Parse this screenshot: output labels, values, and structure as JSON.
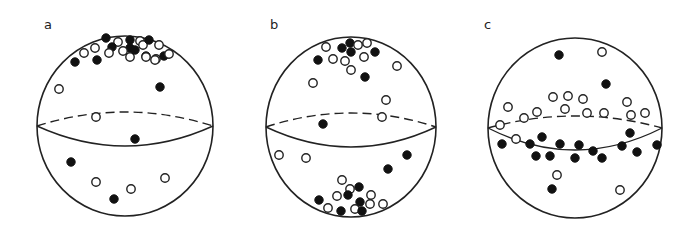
{
  "figure": {
    "legend_symbols": {
      "filled": "filled circle",
      "open": "open circle"
    },
    "colors": {
      "ink": "#222222",
      "background": "#ffffff"
    }
  },
  "panels": [
    {
      "label": "a",
      "label_pos": [
        44,
        29
      ],
      "sphere": {
        "cx": 125,
        "cy": 126,
        "rx": 88,
        "ry": 90
      },
      "equator": {
        "cy": 126,
        "ry": 20,
        "back_offset": -14
      },
      "points": [
        {
          "x": 106,
          "y": 38,
          "t": "filled"
        },
        {
          "x": 118,
          "y": 42,
          "t": "open"
        },
        {
          "x": 112,
          "y": 47,
          "t": "filled"
        },
        {
          "x": 130,
          "y": 40,
          "t": "filled"
        },
        {
          "x": 140,
          "y": 41,
          "t": "open"
        },
        {
          "x": 143,
          "y": 45,
          "t": "open"
        },
        {
          "x": 149,
          "y": 40,
          "t": "filled"
        },
        {
          "x": 159,
          "y": 45,
          "t": "open"
        },
        {
          "x": 130,
          "y": 48,
          "t": "filled"
        },
        {
          "x": 123,
          "y": 51,
          "t": "open"
        },
        {
          "x": 95,
          "y": 48,
          "t": "open"
        },
        {
          "x": 84,
          "y": 53,
          "t": "open"
        },
        {
          "x": 109,
          "y": 53,
          "t": "open"
        },
        {
          "x": 130,
          "y": 57,
          "t": "open"
        },
        {
          "x": 135,
          "y": 50,
          "t": "filled"
        },
        {
          "x": 146,
          "y": 56,
          "t": "filled"
        },
        {
          "x": 146,
          "y": 57,
          "t": "open"
        },
        {
          "x": 156,
          "y": 59,
          "t": "open"
        },
        {
          "x": 155,
          "y": 60,
          "t": "open"
        },
        {
          "x": 164,
          "y": 56,
          "t": "filled"
        },
        {
          "x": 169,
          "y": 54,
          "t": "open"
        },
        {
          "x": 75,
          "y": 62,
          "t": "filled"
        },
        {
          "x": 97,
          "y": 60,
          "t": "filled"
        },
        {
          "x": 59,
          "y": 89,
          "t": "open"
        },
        {
          "x": 160,
          "y": 87,
          "t": "filled"
        },
        {
          "x": 96,
          "y": 117,
          "t": "open"
        },
        {
          "x": 135,
          "y": 139,
          "t": "filled"
        },
        {
          "x": 71,
          "y": 162,
          "t": "filled"
        },
        {
          "x": 96,
          "y": 182,
          "t": "open"
        },
        {
          "x": 165,
          "y": 178,
          "t": "open"
        },
        {
          "x": 131,
          "y": 189,
          "t": "open"
        },
        {
          "x": 114,
          "y": 199,
          "t": "filled"
        }
      ]
    },
    {
      "label": "b",
      "label_pos": [
        270,
        29
      ],
      "sphere": {
        "cx": 351,
        "cy": 127,
        "rx": 85,
        "ry": 90
      },
      "equator": {
        "cy": 127,
        "ry": 20,
        "back_offset": -14
      },
      "points": [
        {
          "x": 326,
          "y": 47,
          "t": "open"
        },
        {
          "x": 342,
          "y": 48,
          "t": "filled"
        },
        {
          "x": 350,
          "y": 43,
          "t": "filled"
        },
        {
          "x": 358,
          "y": 45,
          "t": "open"
        },
        {
          "x": 367,
          "y": 43,
          "t": "open"
        },
        {
          "x": 351,
          "y": 52,
          "t": "filled"
        },
        {
          "x": 375,
          "y": 52,
          "t": "filled"
        },
        {
          "x": 318,
          "y": 60,
          "t": "filled"
        },
        {
          "x": 333,
          "y": 59,
          "t": "open"
        },
        {
          "x": 345,
          "y": 61,
          "t": "open"
        },
        {
          "x": 364,
          "y": 57,
          "t": "open"
        },
        {
          "x": 351,
          "y": 70,
          "t": "open"
        },
        {
          "x": 397,
          "y": 66,
          "t": "open"
        },
        {
          "x": 365,
          "y": 77,
          "t": "filled"
        },
        {
          "x": 313,
          "y": 83,
          "t": "open"
        },
        {
          "x": 386,
          "y": 100,
          "t": "open"
        },
        {
          "x": 382,
          "y": 117,
          "t": "open"
        },
        {
          "x": 323,
          "y": 124,
          "t": "filled"
        },
        {
          "x": 279,
          "y": 155,
          "t": "open"
        },
        {
          "x": 306,
          "y": 158,
          "t": "open"
        },
        {
          "x": 407,
          "y": 155,
          "t": "filled"
        },
        {
          "x": 388,
          "y": 169,
          "t": "filled"
        },
        {
          "x": 342,
          "y": 180,
          "t": "open"
        },
        {
          "x": 350,
          "y": 189,
          "t": "open"
        },
        {
          "x": 359,
          "y": 187,
          "t": "filled"
        },
        {
          "x": 348,
          "y": 195,
          "t": "filled"
        },
        {
          "x": 337,
          "y": 196,
          "t": "open"
        },
        {
          "x": 371,
          "y": 195,
          "t": "open"
        },
        {
          "x": 319,
          "y": 200,
          "t": "filled"
        },
        {
          "x": 360,
          "y": 202,
          "t": "filled"
        },
        {
          "x": 370,
          "y": 204,
          "t": "open"
        },
        {
          "x": 383,
          "y": 204,
          "t": "open"
        },
        {
          "x": 328,
          "y": 208,
          "t": "open"
        },
        {
          "x": 355,
          "y": 209,
          "t": "open"
        },
        {
          "x": 341,
          "y": 211,
          "t": "filled"
        },
        {
          "x": 362,
          "y": 211,
          "t": "filled"
        }
      ]
    },
    {
      "label": "c",
      "label_pos": [
        484,
        29
      ],
      "sphere": {
        "cx": 575,
        "cy": 128,
        "rx": 87,
        "ry": 90
      },
      "equator": {
        "cy": 128,
        "ry": 22,
        "back_offset": -12
      },
      "points": [
        {
          "x": 559,
          "y": 55,
          "t": "filled"
        },
        {
          "x": 602,
          "y": 52,
          "t": "open"
        },
        {
          "x": 606,
          "y": 84,
          "t": "filled"
        },
        {
          "x": 553,
          "y": 97,
          "t": "open"
        },
        {
          "x": 568,
          "y": 96,
          "t": "open"
        },
        {
          "x": 583,
          "y": 99,
          "t": "open"
        },
        {
          "x": 627,
          "y": 102,
          "t": "open"
        },
        {
          "x": 508,
          "y": 107,
          "t": "open"
        },
        {
          "x": 537,
          "y": 112,
          "t": "open"
        },
        {
          "x": 565,
          "y": 109,
          "t": "open"
        },
        {
          "x": 587,
          "y": 113,
          "t": "open"
        },
        {
          "x": 604,
          "y": 113,
          "t": "open"
        },
        {
          "x": 631,
          "y": 115,
          "t": "open"
        },
        {
          "x": 645,
          "y": 113,
          "t": "open"
        },
        {
          "x": 524,
          "y": 118,
          "t": "open"
        },
        {
          "x": 500,
          "y": 125,
          "t": "open"
        },
        {
          "x": 630,
          "y": 133,
          "t": "filled"
        },
        {
          "x": 542,
          "y": 137,
          "t": "filled"
        },
        {
          "x": 516,
          "y": 139,
          "t": "open"
        },
        {
          "x": 502,
          "y": 144,
          "t": "filled"
        },
        {
          "x": 530,
          "y": 144,
          "t": "filled"
        },
        {
          "x": 560,
          "y": 144,
          "t": "filled"
        },
        {
          "x": 579,
          "y": 145,
          "t": "filled"
        },
        {
          "x": 622,
          "y": 146,
          "t": "filled"
        },
        {
          "x": 657,
          "y": 145,
          "t": "filled"
        },
        {
          "x": 593,
          "y": 151,
          "t": "filled"
        },
        {
          "x": 536,
          "y": 156,
          "t": "filled"
        },
        {
          "x": 550,
          "y": 156,
          "t": "filled"
        },
        {
          "x": 575,
          "y": 158,
          "t": "filled"
        },
        {
          "x": 602,
          "y": 158,
          "t": "filled"
        },
        {
          "x": 637,
          "y": 152,
          "t": "filled"
        },
        {
          "x": 557,
          "y": 175,
          "t": "open"
        },
        {
          "x": 552,
          "y": 189,
          "t": "filled"
        },
        {
          "x": 620,
          "y": 190,
          "t": "open"
        }
      ]
    }
  ]
}
